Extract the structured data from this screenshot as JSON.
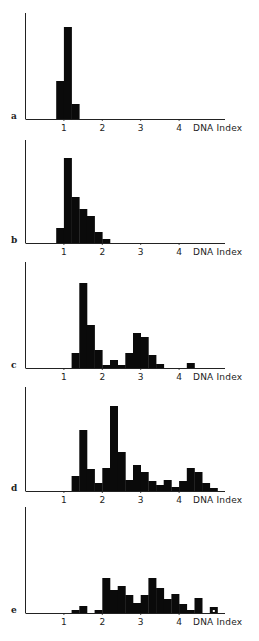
{
  "chart_data": [
    {
      "type": "bar",
      "panel": "a",
      "title": "",
      "xlabel": "DNA Index",
      "ylabel": "",
      "xticks": [
        1,
        2,
        3,
        4
      ],
      "xlim": [
        -0.05,
        4.2
      ],
      "bin_width": 0.2,
      "bins": [
        {
          "x": 0.8,
          "value": 38
        },
        {
          "x": 1.0,
          "value": 92
        },
        {
          "x": 1.2,
          "value": 15
        }
      ]
    },
    {
      "type": "bar",
      "panel": "b",
      "title": "",
      "xlabel": "DNA Index",
      "ylabel": "",
      "xticks": [
        1,
        2,
        3,
        4
      ],
      "xlim": [
        -0.05,
        4.2
      ],
      "bin_width": 0.2,
      "bins": [
        {
          "x": 0.8,
          "value": 15
        },
        {
          "x": 1.0,
          "value": 85
        },
        {
          "x": 1.2,
          "value": 46
        },
        {
          "x": 1.4,
          "value": 34
        },
        {
          "x": 1.6,
          "value": 27
        },
        {
          "x": 1.8,
          "value": 11
        },
        {
          "x": 2.0,
          "value": 4
        }
      ]
    },
    {
      "type": "bar",
      "panel": "c",
      "title": "",
      "xlabel": "DNA Index",
      "ylabel": "",
      "xticks": [
        1,
        2,
        3,
        4
      ],
      "xlim": [
        -0.05,
        4.2
      ],
      "bin_width": 0.2,
      "bins": [
        {
          "x": 1.2,
          "value": 15
        },
        {
          "x": 1.4,
          "value": 85
        },
        {
          "x": 1.6,
          "value": 43
        },
        {
          "x": 1.8,
          "value": 18
        },
        {
          "x": 2.0,
          "value": 3
        },
        {
          "x": 2.2,
          "value": 8
        },
        {
          "x": 2.4,
          "value": 3
        },
        {
          "x": 2.6,
          "value": 15
        },
        {
          "x": 2.8,
          "value": 35
        },
        {
          "x": 3.0,
          "value": 31
        },
        {
          "x": 3.2,
          "value": 13
        },
        {
          "x": 3.4,
          "value": 4
        },
        {
          "x": 3.6,
          "value": 0
        },
        {
          "x": 3.8,
          "value": 0
        },
        {
          "x": 4.2,
          "value": 5
        }
      ]
    },
    {
      "type": "bar",
      "panel": "d",
      "title": "",
      "xlabel": "DNA Index",
      "ylabel": "",
      "xticks": [
        1,
        2,
        3,
        4
      ],
      "xlim": [
        -0.05,
        4.2
      ],
      "bin_width": 0.2,
      "bins": [
        {
          "x": 1.2,
          "value": 15
        },
        {
          "x": 1.4,
          "value": 61
        },
        {
          "x": 1.6,
          "value": 22
        },
        {
          "x": 1.8,
          "value": 8
        },
        {
          "x": 2.0,
          "value": 23
        },
        {
          "x": 2.2,
          "value": 85
        },
        {
          "x": 2.4,
          "value": 39
        },
        {
          "x": 2.6,
          "value": 11
        },
        {
          "x": 2.8,
          "value": 26
        },
        {
          "x": 3.0,
          "value": 19
        },
        {
          "x": 3.2,
          "value": 10
        },
        {
          "x": 3.4,
          "value": 6
        },
        {
          "x": 3.6,
          "value": 11
        },
        {
          "x": 3.8,
          "value": 4
        },
        {
          "x": 4.0,
          "value": 10
        },
        {
          "x": 4.2,
          "value": 23
        },
        {
          "x": 4.4,
          "value": 19
        },
        {
          "x": 4.6,
          "value": 8
        },
        {
          "x": 4.8,
          "value": 3
        }
      ]
    },
    {
      "type": "bar",
      "panel": "e",
      "title": "",
      "xlabel": "DNA Index",
      "ylabel": "",
      "xticks": [
        1,
        2,
        3,
        4
      ],
      "xlim": [
        -0.05,
        4.2
      ],
      "bin_width": 0.2,
      "bins": [
        {
          "x": 1.2,
          "value": 3
        },
        {
          "x": 1.4,
          "value": 7
        },
        {
          "x": 1.8,
          "value": 3
        },
        {
          "x": 2.0,
          "value": 35
        },
        {
          "x": 2.2,
          "value": 23
        },
        {
          "x": 2.4,
          "value": 27
        },
        {
          "x": 2.6,
          "value": 18
        },
        {
          "x": 2.8,
          "value": 10
        },
        {
          "x": 3.0,
          "value": 18
        },
        {
          "x": 3.2,
          "value": 35
        },
        {
          "x": 3.4,
          "value": 25
        },
        {
          "x": 3.6,
          "value": 14
        },
        {
          "x": 3.8,
          "value": 19
        },
        {
          "x": 4.0,
          "value": 9
        },
        {
          "x": 4.2,
          "value": 3
        },
        {
          "x": 4.4,
          "value": 15
        },
        {
          "x": 4.8,
          "value": 6
        }
      ]
    }
  ],
  "panels": [
    {
      "label": "a",
      "xlabel": "DNA Index",
      "ticks": [
        "1",
        "2",
        "3",
        "4"
      ]
    },
    {
      "label": "b",
      "xlabel": "DNA Index",
      "ticks": [
        "1",
        "2",
        "3",
        "4"
      ]
    },
    {
      "label": "c",
      "xlabel": "DNA Index",
      "ticks": [
        "1",
        "2",
        "3",
        "4"
      ]
    },
    {
      "label": "d",
      "xlabel": "DNA Index",
      "ticks": [
        "1",
        "2",
        "3",
        "4"
      ]
    },
    {
      "label": "e",
      "xlabel": "DNA Index",
      "ticks": [
        "1",
        "2",
        "3",
        "4"
      ]
    }
  ],
  "colors": {
    "bar": "#0a0a0a",
    "axis": "#222222",
    "background": "#ffffff"
  }
}
